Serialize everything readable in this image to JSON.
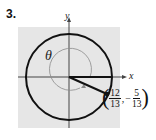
{
  "problem": {
    "number": "3."
  },
  "diagram": {
    "axis_x_label": "x",
    "axis_y_label": "y",
    "angle_label": "θ",
    "point": {
      "x_num": "12",
      "x_den": "13",
      "y_sign": "−",
      "y_num": "5",
      "y_den": "13",
      "open_paren": "(",
      "close_paren": ")",
      "comma": ","
    },
    "colors": {
      "background_panel": "#e6e6e6",
      "circle": "#111111",
      "angle_arc": "#8a8a8a",
      "axes": "#444444"
    }
  }
}
